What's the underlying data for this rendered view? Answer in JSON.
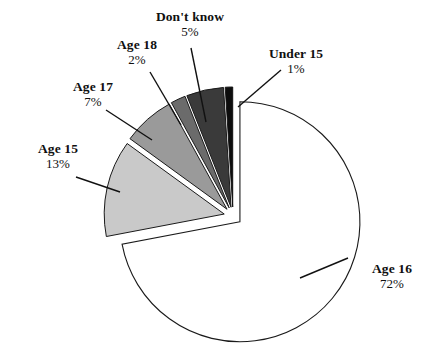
{
  "chart_data": {
    "type": "pie",
    "title": "",
    "subtitle": "",
    "xlabel": "",
    "ylabel": "",
    "legend_position": "none",
    "grid": false,
    "units": "percent",
    "exploded": true,
    "start_angle_deg": 90,
    "direction": "counterclockwise",
    "categories": [
      "Age 16",
      "Age 15",
      "Age 17",
      "Age 18",
      "Don't know",
      "Under 15"
    ],
    "values": [
      72,
      13,
      7,
      2,
      5,
      1
    ],
    "slices": [
      {
        "label": "Age 16",
        "value": 72,
        "value_text": "72%",
        "color": "#ffffff",
        "stroke": "#1a1a1a",
        "order": 1
      },
      {
        "label": "Age 15",
        "value": 13,
        "value_text": "13%",
        "color": "#c9c9c9",
        "stroke": "#1a1a1a",
        "order": 2
      },
      {
        "label": "Age 17",
        "value": 7,
        "value_text": "7%",
        "color": "#9a9a9a",
        "stroke": "#1a1a1a",
        "order": 3
      },
      {
        "label": "Age 18",
        "value": 2,
        "value_text": "2%",
        "color": "#6b6b6b",
        "stroke": "#1a1a1a",
        "order": 4
      },
      {
        "label": "Don't know",
        "value": 5,
        "value_text": "5%",
        "color": "#3a3a3a",
        "stroke": "#1a1a1a",
        "order": 5
      },
      {
        "label": "Under 15",
        "value": 1,
        "value_text": "1%",
        "color": "#0d0d0d",
        "stroke": "#0d0d0d",
        "order": 6
      }
    ]
  },
  "labels": {
    "dont_know": {
      "name": "Don't know",
      "pct": "5%"
    },
    "age_18": {
      "name": "Age 18",
      "pct": "2%"
    },
    "age_17": {
      "name": "Age 17",
      "pct": "7%"
    },
    "age_15": {
      "name": "Age 15",
      "pct": "13%"
    },
    "under_15": {
      "name": "Under 15",
      "pct": "1%"
    },
    "age_16": {
      "name": "Age 16",
      "pct": "72%"
    }
  },
  "colors": {
    "background": "#ffffff",
    "text": "#101010",
    "leader_line": "#111111"
  }
}
